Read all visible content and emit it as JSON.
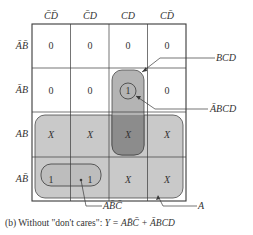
{
  "kmap": {
    "column_headers": [
      "C̄D̄",
      "C̄D",
      "CD",
      "CD̄"
    ],
    "row_headers": [
      "ĀB̄",
      "ĀB",
      "AB",
      "AB̄"
    ],
    "cells": [
      [
        "0",
        "0",
        "0",
        "0"
      ],
      [
        "0",
        "0",
        "1",
        "0"
      ],
      [
        "X",
        "X",
        "X",
        "X"
      ],
      [
        "1",
        "1",
        "X",
        "X"
      ]
    ]
  },
  "annotations": {
    "bcd": "BCD",
    "abar_bcd": "ĀBCD",
    "a_bbar_cbar": "AB̄C̄",
    "a": "A"
  },
  "caption": {
    "prefix": "(b) Without \"don't cares\": ",
    "equation": "Y = AB̄C̄ + ĀBCD"
  },
  "colors": {
    "grid_line": "#3a3a3a",
    "loop_light": "#c8c8c8",
    "loop_medium": "#b0b0b0",
    "loop_dark": "#8a8a8a"
  }
}
